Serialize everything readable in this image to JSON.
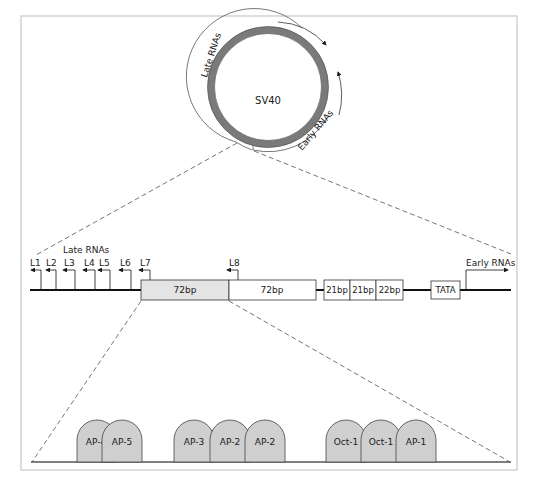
{
  "circle": {
    "label": "SV40",
    "late_rnas_label": "Late RNAs",
    "early_rnas_label": "Early RNAs",
    "ring_color": "#7a7a7a"
  },
  "middle": {
    "late_rnas_label": "Late RNAs",
    "early_rnas_label": "Early RNAs",
    "late_starts": [
      "L1",
      "L2",
      "L3",
      "L4",
      "L5",
      "L6",
      "L7",
      "L8"
    ],
    "boxes": [
      {
        "label": "72bp",
        "fill": "#e4e4e4"
      },
      {
        "label": "72bp",
        "fill": "#ffffff"
      },
      {
        "label": "21bp",
        "fill": "#ffffff"
      },
      {
        "label": "21bp",
        "fill": "#ffffff"
      },
      {
        "label": "22bp",
        "fill": "#ffffff"
      },
      {
        "label": "TATA",
        "fill": "#ffffff"
      }
    ]
  },
  "bottom": {
    "factors": [
      "AP-4",
      "AP-5",
      "AP-3",
      "AP-2",
      "AP-2",
      "Oct-1",
      "Oct-1",
      "AP-1"
    ],
    "factor_fill": "#cfcfcf"
  }
}
